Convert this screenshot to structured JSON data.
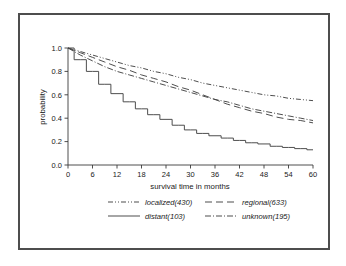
{
  "chart_data": {
    "type": "line",
    "title": "",
    "subtitle": "",
    "xlabel": "survival time in months",
    "ylabel": "probability",
    "xlim": [
      0,
      60
    ],
    "ylim": [
      0.0,
      1.0
    ],
    "xticks": [
      0,
      6,
      12,
      18,
      24,
      30,
      36,
      42,
      48,
      54,
      60
    ],
    "yticks": [
      "0.0",
      "0.2",
      "0.4",
      "0.6",
      "0.8",
      "1.0"
    ],
    "grid": false,
    "legend_position": "below-axes",
    "x": [
      0,
      3,
      6,
      9,
      12,
      15,
      18,
      21,
      24,
      27,
      30,
      33,
      36,
      39,
      42,
      45,
      48,
      51,
      54,
      57,
      60
    ],
    "series": [
      {
        "name": "localized(430)",
        "label": "localized(430)",
        "style": "dash-dot-dot",
        "values": [
          1.0,
          0.97,
          0.94,
          0.91,
          0.88,
          0.85,
          0.83,
          0.8,
          0.78,
          0.75,
          0.73,
          0.7,
          0.68,
          0.66,
          0.64,
          0.62,
          0.6,
          0.59,
          0.57,
          0.56,
          0.55
        ]
      },
      {
        "name": "regional(633)",
        "label": "regional(633)",
        "style": "dashed",
        "values": [
          1.0,
          0.96,
          0.92,
          0.88,
          0.84,
          0.81,
          0.77,
          0.74,
          0.71,
          0.67,
          0.64,
          0.6,
          0.56,
          0.52,
          0.49,
          0.46,
          0.44,
          0.41,
          0.39,
          0.38,
          0.36
        ]
      },
      {
        "name": "distant(103)",
        "label": "distant(103)",
        "style": "solid",
        "values": [
          1.0,
          0.9,
          0.8,
          0.69,
          0.61,
          0.54,
          0.48,
          0.43,
          0.39,
          0.34,
          0.3,
          0.27,
          0.25,
          0.23,
          0.21,
          0.19,
          0.18,
          0.16,
          0.15,
          0.14,
          0.13
        ]
      },
      {
        "name": "unknown(195)",
        "label": "unknown(195)",
        "style": "dash-dot",
        "values": [
          1.0,
          0.94,
          0.89,
          0.84,
          0.8,
          0.77,
          0.74,
          0.71,
          0.68,
          0.65,
          0.62,
          0.59,
          0.56,
          0.54,
          0.51,
          0.48,
          0.46,
          0.44,
          0.42,
          0.4,
          0.38
        ]
      }
    ]
  },
  "axes": {
    "x_title": "survival time in months",
    "y_title": "probability",
    "x_tick_labels": [
      "0",
      "6",
      "12",
      "18",
      "24",
      "30",
      "36",
      "42",
      "48",
      "54",
      "60"
    ],
    "y_tick_labels": [
      "0.0",
      "0.2",
      "0.4",
      "0.6",
      "0.8",
      "1.0"
    ]
  },
  "legend": {
    "entries": [
      {
        "label": "localized(430)",
        "style": "dash-dot-dot"
      },
      {
        "label": "regional(633)",
        "style": "dashed"
      },
      {
        "label": "distant(103)",
        "style": "solid"
      },
      {
        "label": "unknown(195)",
        "style": "dash-dot"
      }
    ]
  },
  "colors": {
    "curve": "#444444",
    "axis": "#3a3a3a",
    "frame": "#4d4d4d",
    "text": "#1a1a1a",
    "background": "#ffffff"
  }
}
